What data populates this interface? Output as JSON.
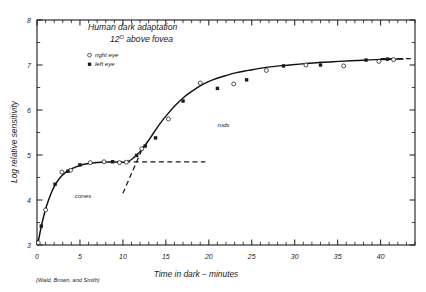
{
  "figure": {
    "title_line1": "Human dark adaptation",
    "title_line2_value": "12",
    "title_line2_sup": "O",
    "title_line2_rest": " above fovea",
    "credit": "(Wald, Brown, and Smith)"
  },
  "legend": {
    "items": [
      {
        "marker": "open-circle",
        "label": "right eye",
        "glyph": "o"
      },
      {
        "marker": "filled-circle",
        "label": "left eye",
        "glyph": "▪"
      }
    ]
  },
  "annotations": {
    "cones": "cones",
    "rods": "rods"
  },
  "axes": {
    "x_label": "Time in dark – minutes",
    "y_label": "Log relative sensitivity",
    "x_ticks": [
      "0",
      "5",
      "10",
      "15",
      "20",
      "25",
      "30",
      "35",
      "40"
    ],
    "y_ticks": [
      "3",
      "4",
      "5",
      "6",
      "7",
      "8"
    ]
  },
  "colors": {
    "ink": "#1a1a1a",
    "curve": "#111111",
    "frame": "#1a1a1a",
    "background": "#ffffff"
  },
  "chart_data": {
    "type": "scatter",
    "xlabel": "Time in dark – minutes",
    "ylabel": "Log relative sensitivity",
    "xlim": [
      0,
      44
    ],
    "ylim": [
      3,
      8
    ],
    "xticks": [
      0,
      5,
      10,
      15,
      20,
      25,
      30,
      35,
      40
    ],
    "yticks": [
      3,
      4,
      5,
      6,
      7,
      8
    ],
    "xtick_minor_step": 1,
    "ytick_minor_step": 0.5,
    "grid": false,
    "legend_position": "upper-left-inside",
    "series": [
      {
        "name": "right eye",
        "marker": "open-circle",
        "points": [
          [
            0.15,
            3.05
          ],
          [
            1.0,
            3.78
          ],
          [
            2.9,
            4.62
          ],
          [
            3.9,
            4.66
          ],
          [
            6.2,
            4.83
          ],
          [
            7.8,
            4.85
          ],
          [
            9.6,
            4.83
          ],
          [
            10.4,
            4.84
          ],
          [
            12.2,
            5.14
          ],
          [
            15.3,
            5.8
          ],
          [
            19.0,
            6.6
          ],
          [
            22.9,
            6.58
          ],
          [
            26.7,
            6.88
          ],
          [
            31.3,
            7.0
          ],
          [
            35.7,
            6.98
          ],
          [
            39.8,
            7.08
          ],
          [
            41.5,
            7.12
          ]
        ]
      },
      {
        "name": "left eye",
        "marker": "filled-circle",
        "points": [
          [
            0.5,
            3.42
          ],
          [
            2.1,
            4.35
          ],
          [
            3.6,
            4.64
          ],
          [
            5.0,
            4.78
          ],
          [
            8.8,
            4.85
          ],
          [
            11.6,
            4.99
          ],
          [
            12.6,
            5.2
          ],
          [
            13.8,
            5.38
          ],
          [
            17.0,
            6.2
          ],
          [
            21.0,
            6.48
          ],
          [
            24.4,
            6.67
          ],
          [
            28.7,
            6.98
          ],
          [
            33.0,
            7.0
          ],
          [
            38.3,
            7.11
          ],
          [
            40.8,
            7.13
          ]
        ]
      }
    ],
    "fitted_curve": [
      [
        0.1,
        3.03
      ],
      [
        0.6,
        3.5
      ],
      [
        1.1,
        3.86
      ],
      [
        1.6,
        4.13
      ],
      [
        2.1,
        4.33
      ],
      [
        2.7,
        4.5
      ],
      [
        3.3,
        4.61
      ],
      [
        4.0,
        4.69
      ],
      [
        5.0,
        4.77
      ],
      [
        6.0,
        4.81
      ],
      [
        7.0,
        4.835
      ],
      [
        8.0,
        4.845
      ],
      [
        9.0,
        4.845
      ],
      [
        9.8,
        4.84
      ],
      [
        10.4,
        4.845
      ],
      [
        11.0,
        4.9
      ],
      [
        11.6,
        5.0
      ],
      [
        12.2,
        5.12
      ],
      [
        12.9,
        5.3
      ],
      [
        13.6,
        5.5
      ],
      [
        14.4,
        5.72
      ],
      [
        15.3,
        5.93
      ],
      [
        16.2,
        6.12
      ],
      [
        17.2,
        6.3
      ],
      [
        18.3,
        6.45
      ],
      [
        19.4,
        6.58
      ],
      [
        20.6,
        6.68
      ],
      [
        21.9,
        6.76
      ],
      [
        23.2,
        6.83
      ],
      [
        24.6,
        6.88
      ],
      [
        26.1,
        6.93
      ],
      [
        27.7,
        6.97
      ],
      [
        29.4,
        7.0
      ],
      [
        31.2,
        7.03
      ],
      [
        33.1,
        7.06
      ],
      [
        35.1,
        7.08
      ],
      [
        37.2,
        7.1
      ],
      [
        39.4,
        7.12
      ],
      [
        41.5,
        7.13
      ],
      [
        42.6,
        7.135
      ]
    ],
    "reference_lines": [
      {
        "name": "cone-asymptote",
        "style": "dashed",
        "from": [
          9.3,
          4.845
        ],
        "to": [
          19.6,
          4.845
        ]
      },
      {
        "name": "rod-extrapolation",
        "style": "dashed",
        "from": [
          10.0,
          4.15
        ],
        "to": [
          12.4,
          5.2
        ]
      },
      {
        "name": "rod-asymptote",
        "style": "dashed",
        "from": [
          40.0,
          7.14
        ],
        "to": [
          43.6,
          7.14
        ]
      }
    ],
    "annotations": [
      {
        "text": "cones",
        "x": 4.4,
        "y": 4.05
      },
      {
        "text": "rods",
        "x": 21.0,
        "y": 5.62
      }
    ]
  }
}
